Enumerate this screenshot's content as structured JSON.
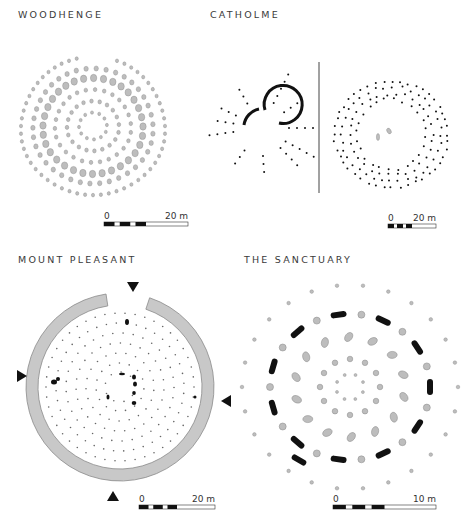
{
  "panels": [
    {
      "id": "woodhenge",
      "title": "WOODHENGE",
      "title_pos": [
        18,
        14
      ],
      "scale": {
        "x": 104,
        "y": 222,
        "w": 84,
        "label_zero": "0",
        "label_end": "20 m"
      }
    },
    {
      "id": "catholme",
      "title": "CATHOLME",
      "title_pos": [
        210,
        14
      ],
      "scale": {
        "x": 388,
        "y": 224,
        "w": 48,
        "label_zero": "0",
        "label_end": "20 m"
      }
    },
    {
      "id": "mount-pleasant",
      "title": "MOUNT PLEASANT",
      "title_pos": [
        18,
        259
      ],
      "scale": {
        "x": 139,
        "y": 505,
        "w": 76,
        "label_zero": "0",
        "label_end": "20 m"
      }
    },
    {
      "id": "the-sanctuary",
      "title": "THE SANCTUARY",
      "title_pos": [
        244,
        259
      ],
      "scale": {
        "x": 333,
        "y": 505,
        "w": 103,
        "label_zero": "0",
        "label_end": "10 m"
      }
    }
  ],
  "colors": {
    "post_fill": "#bdbdbd",
    "post_stroke": "#888888",
    "ink": "#111111",
    "bank_fill": "#c8c8c8",
    "bank_stroke": "#8a8a8a"
  },
  "markers": {
    "mount_pleasant_entrances": [
      "north",
      "west",
      "east",
      "south"
    ]
  }
}
